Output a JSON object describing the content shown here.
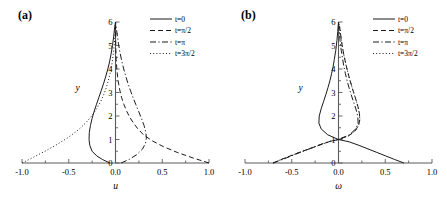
{
  "figure": {
    "panels": [
      {
        "id": "a",
        "label": "(a)",
        "xlabel": "u",
        "ylabel": "y",
        "xlim": [
          -1.0,
          1.0
        ],
        "ylim": [
          0,
          6
        ],
        "xticks": [
          -1.0,
          -0.5,
          0.0,
          0.5,
          1.0
        ],
        "xtick_labels": [
          "-1.0",
          "-0.5",
          "0.0",
          "0.5",
          "1.0"
        ],
        "xminor_step": 0.25,
        "yticks": [
          0,
          1,
          2,
          3,
          4,
          5,
          6
        ],
        "ytick_labels": [
          "0",
          "1",
          "2",
          "3",
          "4",
          "5",
          "6"
        ]
      },
      {
        "id": "b",
        "label": "(b)",
        "xlabel": "ω",
        "ylabel": "y",
        "xlim": [
          -1.0,
          1.0
        ],
        "ylim": [
          0,
          6
        ],
        "xticks": [
          -1.0,
          -0.5,
          0.0,
          0.5,
          1.0
        ],
        "xtick_labels": [
          "-1.0",
          "-0.5",
          "0.0",
          "0.5",
          "1.0"
        ],
        "xminor_step": 0.25,
        "yticks": [
          0,
          1,
          2,
          3,
          4,
          5,
          6
        ],
        "ytick_labels": [
          "0",
          "1",
          "2",
          "3",
          "4",
          "5",
          "6"
        ]
      }
    ],
    "legend": {
      "position": "top-right",
      "entries": [
        {
          "label": "t=0",
          "dash": "none"
        },
        {
          "label": "t=π/2",
          "dash": "dashed"
        },
        {
          "label": "t=π",
          "dash": "dashdot"
        },
        {
          "label": "t=3π/2",
          "dash": "dotted"
        }
      ]
    }
  },
  "chart_data": [
    {
      "type": "line",
      "panel": "a",
      "title": "(a)",
      "xlabel": "u",
      "ylabel": "y",
      "xlim": [
        -1.0,
        1.0
      ],
      "ylim": [
        0,
        6
      ],
      "grid": false,
      "legend_position": "top-right",
      "series": [
        {
          "name": "t=0",
          "dash": "none",
          "y": [
            0,
            0.15,
            0.3,
            0.5,
            0.75,
            1.0,
            1.3,
            1.6,
            1.9,
            2.2,
            2.5,
            2.8,
            3.1,
            3.4,
            3.7,
            4.0,
            4.3,
            4.6,
            5.0,
            5.4,
            5.7,
            6.0
          ],
          "x": [
            -0.06,
            -0.14,
            -0.2,
            -0.25,
            -0.275,
            -0.283,
            -0.28,
            -0.268,
            -0.25,
            -0.228,
            -0.203,
            -0.177,
            -0.151,
            -0.126,
            -0.103,
            -0.082,
            -0.064,
            -0.049,
            -0.032,
            -0.019,
            -0.011,
            0.0
          ]
        },
        {
          "name": "t=π/2",
          "dash": "dashed",
          "y": [
            0,
            0.2,
            0.45,
            0.7,
            0.95,
            1.2,
            1.45,
            1.7,
            1.95,
            2.2,
            2.5,
            2.8,
            3.1,
            3.4,
            3.7,
            4.0,
            4.4,
            4.8,
            5.2,
            5.6,
            6.0
          ],
          "x": [
            1.0,
            0.84,
            0.66,
            0.51,
            0.39,
            0.3,
            0.24,
            0.192,
            0.152,
            0.12,
            0.089,
            0.064,
            0.046,
            0.032,
            0.022,
            0.014,
            0.0075,
            0.004,
            0.002,
            0.0008,
            0.0
          ]
        },
        {
          "name": "t=π",
          "dash": "dashdot",
          "y": [
            0,
            0.15,
            0.35,
            0.6,
            0.85,
            1.05,
            1.3,
            1.6,
            1.9,
            2.2,
            2.5,
            2.8,
            3.1,
            3.4,
            3.7,
            4.0,
            4.3,
            4.7,
            5.1,
            5.5,
            6.0
          ],
          "x": [
            0.06,
            0.145,
            0.225,
            0.29,
            0.322,
            0.33,
            0.325,
            0.305,
            0.277,
            0.247,
            0.216,
            0.186,
            0.158,
            0.132,
            0.109,
            0.088,
            0.069,
            0.048,
            0.031,
            0.017,
            0.0
          ]
        },
        {
          "name": "t=3π/2",
          "dash": "dotted",
          "y": [
            0,
            0.25,
            0.5,
            0.8,
            1.1,
            1.4,
            1.7,
            2.0,
            2.3,
            2.6,
            2.9,
            3.2,
            3.5,
            3.8,
            4.1,
            4.4,
            4.8,
            5.2,
            5.6,
            6.0
          ],
          "x": [
            -1.0,
            -0.875,
            -0.755,
            -0.62,
            -0.5,
            -0.4,
            -0.32,
            -0.255,
            -0.203,
            -0.161,
            -0.127,
            -0.099,
            -0.077,
            -0.058,
            -0.043,
            -0.031,
            -0.019,
            -0.01,
            -0.004,
            0.0
          ]
        }
      ]
    },
    {
      "type": "line",
      "panel": "b",
      "title": "(b)",
      "xlabel": "ω",
      "ylabel": "y",
      "xlim": [
        -1.0,
        1.0
      ],
      "ylim": [
        0,
        6
      ],
      "grid": false,
      "legend_position": "top-right",
      "node": {
        "x": 0.0,
        "y": 1.0
      },
      "series": [
        {
          "name": "t=0",
          "dash": "none",
          "y": [
            0,
            0.15,
            0.3,
            0.45,
            0.6,
            0.75,
            0.9,
            1.0,
            1.2,
            1.45,
            1.7,
            2.0,
            2.3,
            2.6,
            2.9,
            3.2,
            3.5,
            3.8,
            4.1,
            4.4,
            4.8,
            5.2,
            5.6,
            6.0
          ],
          "x": [
            0.7,
            0.6,
            0.505,
            0.41,
            0.315,
            0.22,
            0.115,
            0.0,
            -0.115,
            -0.185,
            -0.21,
            -0.206,
            -0.186,
            -0.161,
            -0.136,
            -0.113,
            -0.092,
            -0.074,
            -0.058,
            -0.045,
            -0.029,
            -0.017,
            -0.008,
            0.0
          ]
        },
        {
          "name": "t=π/2",
          "dash": "dashed",
          "y": [
            0,
            0.12,
            0.28,
            0.45,
            0.62,
            0.8,
            0.92,
            1.0,
            1.15,
            1.35,
            1.6,
            1.85,
            2.1,
            2.4,
            2.7,
            3.0,
            3.3,
            3.6,
            3.9,
            4.2,
            4.6,
            5.0,
            5.4,
            5.8,
            6.0
          ],
          "x": [
            -0.7,
            -0.63,
            -0.53,
            -0.42,
            -0.3,
            -0.175,
            -0.09,
            0.0,
            0.105,
            0.175,
            0.215,
            0.228,
            0.224,
            0.208,
            0.186,
            0.162,
            0.139,
            0.117,
            0.097,
            0.079,
            0.057,
            0.039,
            0.025,
            0.012,
            0.0
          ]
        },
        {
          "name": "t=π",
          "dash": "dashdot",
          "y": [
            0,
            0.15,
            0.3,
            0.45,
            0.6,
            0.75,
            0.9,
            1.0,
            1.2,
            1.45,
            1.7,
            2.0,
            2.3,
            2.6,
            2.9,
            3.2,
            3.5,
            3.8,
            4.1,
            4.4,
            4.8,
            5.2,
            5.6,
            6.0
          ],
          "x": [
            -0.7,
            -0.6,
            -0.505,
            -0.41,
            -0.315,
            -0.22,
            -0.115,
            0.0,
            0.115,
            0.185,
            0.21,
            0.206,
            0.186,
            0.161,
            0.136,
            0.113,
            0.092,
            0.074,
            0.058,
            0.045,
            0.029,
            0.017,
            0.008,
            0.0
          ]
        },
        {
          "name": "t=3π/2",
          "dash": "dotted",
          "y": [
            0,
            0.12,
            0.28,
            0.45,
            0.62,
            0.8,
            0.92,
            1.0,
            1.15,
            1.35,
            1.6,
            1.85,
            2.1,
            2.4,
            2.7,
            3.0,
            3.3,
            3.6,
            3.9,
            4.2,
            4.6,
            5.0,
            5.4,
            5.8,
            6.0
          ],
          "x": [
            -0.7,
            -0.63,
            -0.53,
            -0.42,
            -0.3,
            -0.175,
            -0.09,
            0.0,
            0.105,
            0.175,
            0.215,
            0.228,
            0.224,
            0.208,
            0.186,
            0.162,
            0.139,
            0.117,
            0.097,
            0.079,
            0.057,
            0.039,
            0.025,
            0.012,
            0.0
          ]
        }
      ]
    }
  ]
}
